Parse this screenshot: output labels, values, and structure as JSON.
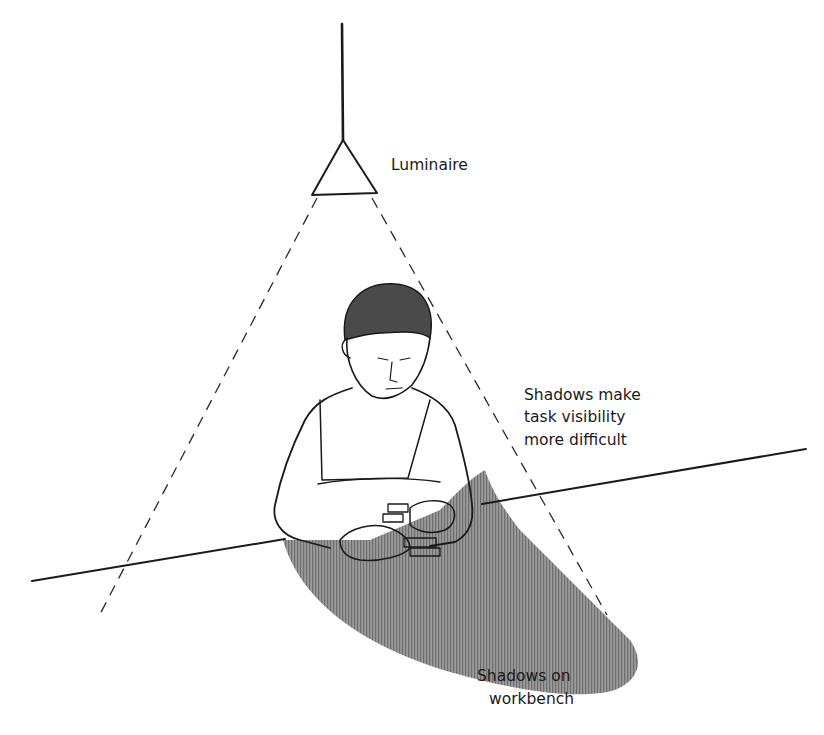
{
  "diagram": {
    "labels": {
      "luminaire": "Luminaire",
      "shadows_task": [
        "Shadows make",
        "task visibility",
        "more difficult"
      ],
      "shadows_bench": [
        "Shadows on",
        "workbench"
      ]
    },
    "elements": {
      "light_source": "luminaire (triangle) hanging from a ceiling cord",
      "light_cone": "dashed lines indicating the light spread",
      "worker": "seated worker stacking blocks at a workbench",
      "shadow": "shaded area cast on the workbench"
    },
    "colors": {
      "line": "#1a1a1a",
      "shadow": "#8a8a8a",
      "background": "#ffffff"
    }
  }
}
